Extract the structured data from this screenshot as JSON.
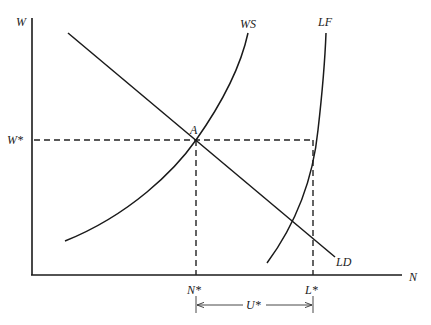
{
  "diagram": {
    "type": "labor-market equilibrium",
    "axes": {
      "y_label": "W",
      "x_label": "N"
    },
    "curves": [
      {
        "id": "WS",
        "label": "WS",
        "description": "wage-setting curve, upward sloping convex"
      },
      {
        "id": "LD",
        "label": "LD",
        "description": "labor demand, downward sloping line"
      },
      {
        "id": "LF",
        "label": "LF",
        "description": "labor force, steep upward curve"
      }
    ],
    "points": {
      "equilibrium": {
        "label": "A"
      }
    },
    "levels": {
      "wage": "W*",
      "employment": "N*",
      "labor_force": "L*",
      "unemployment": "U*"
    }
  }
}
